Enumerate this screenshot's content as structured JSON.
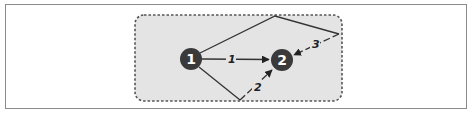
{
  "diagram": {
    "colors": {
      "frame_border": "#8a8a8a",
      "region_fill": "#e4e4e4",
      "region_border": "#555555",
      "node_fill": "#3a3a3a",
      "node_text": "#ffffff",
      "edge": "#333333"
    },
    "region": {
      "x": 135,
      "y": 15,
      "width": 207,
      "height": 86,
      "style": "dashed"
    },
    "nodes": [
      {
        "id": "n1",
        "label": "1",
        "cx": 191,
        "cy": 59,
        "r": 11
      },
      {
        "id": "n2",
        "label": "2",
        "cx": 282,
        "cy": 60,
        "r": 11
      }
    ],
    "vertices": [
      {
        "id": "top",
        "x": 275,
        "y": 16
      },
      {
        "id": "right",
        "x": 339,
        "y": 34
      },
      {
        "id": "bottom",
        "x": 240,
        "y": 100
      }
    ],
    "paths": [
      {
        "label": "1",
        "route": "node1 → node2 (direct)"
      },
      {
        "label": "2",
        "route": "node1 → bottom → node2"
      },
      {
        "label": "3",
        "route": "node1 → top → right → node2"
      }
    ]
  }
}
